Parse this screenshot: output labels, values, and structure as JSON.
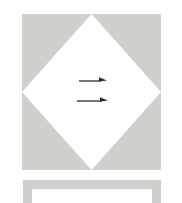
{
  "figure": {
    "title": "",
    "background_color": "#ffffff",
    "width": 182,
    "height": 203
  },
  "shapes": {
    "gray_square": {
      "name": "gray-square",
      "label": "",
      "fill_color": "#cfcfcb",
      "x": 22,
      "y": 14,
      "width": 139,
      "height": 156
    },
    "white_diamond": {
      "name": "white-diamond",
      "label": "",
      "fill_color": "#ffffff",
      "x": 22,
      "y": 14,
      "width": 139,
      "height": 156
    },
    "bottom_panel": {
      "name": "bottom-panel",
      "label": "",
      "border_color": "#cfcfcb",
      "fill_color": "#ffffff",
      "x": 23,
      "y": 180,
      "width": 138,
      "height": 23
    }
  },
  "arrows": [
    {
      "name": "arrow-upper",
      "label": "",
      "direction": "right",
      "color": "#2b2b2b",
      "x": 79,
      "y": 76,
      "length": 28
    },
    {
      "name": "arrow-lower",
      "label": "",
      "direction": "right",
      "color": "#2b2b2b",
      "x": 77,
      "y": 96,
      "length": 31
    }
  ],
  "annotations": []
}
